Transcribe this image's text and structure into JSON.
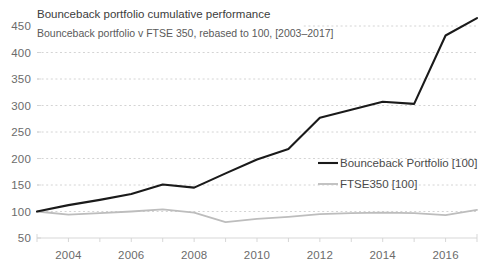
{
  "chart_data": {
    "type": "line",
    "title": "Bounceback portfolio cumulative performance",
    "subtitle": "Bounceback portfolio v FTSE 350, rebased to 100, [2003–2017]",
    "xlabel": "",
    "ylabel": "",
    "grid": true,
    "legend_position": "inside-right",
    "x": [
      2003,
      2004,
      2005,
      2006,
      2007,
      2008,
      2009,
      2010,
      2011,
      2012,
      2013,
      2014,
      2015,
      2016,
      2017
    ],
    "xlim": [
      2003,
      2017
    ],
    "ylim": [
      50,
      450
    ],
    "xticks": [
      2004,
      2006,
      2008,
      2010,
      2012,
      2014,
      2016
    ],
    "xtick_labels": [
      "2004",
      "2006",
      "2008",
      "2010",
      "2012",
      "2014",
      "2016"
    ],
    "yticks": [
      50,
      100,
      150,
      200,
      250,
      300,
      350,
      400,
      450
    ],
    "ytick_labels": [
      "50",
      "100",
      "150",
      "200",
      "250",
      "300",
      "350",
      "400",
      "450"
    ],
    "series": [
      {
        "name": "Bounceback Portfolio [100]",
        "color": "#1a1a1a",
        "values": [
          100,
          112,
          122,
          133,
          151,
          145,
          172,
          198,
          218,
          277,
          292,
          307,
          303,
          432,
          465
        ]
      },
      {
        "name": "FTSE350 [100]",
        "color": "#bdbdbd",
        "values": [
          100,
          94,
          97,
          100,
          104,
          98,
          80,
          86,
          90,
          95,
          97,
          98,
          97,
          93,
          103
        ]
      }
    ],
    "legend": [
      {
        "label": "Bounceback Portfolio [100]",
        "color": "#1a1a1a"
      },
      {
        "label": "FTSE350 [100]",
        "color": "#bdbdbd"
      }
    ]
  }
}
